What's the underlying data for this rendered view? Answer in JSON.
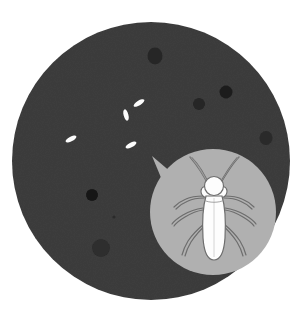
{
  "illustration": {
    "title": "Pest inspection illustration",
    "description": "Dark round surface with scattered dark spots and white insect eggs, with a magnified bubble showing a white winged insect",
    "canvas": {
      "width": 301,
      "height": 332,
      "background": "#ffffff"
    },
    "surface": {
      "label": "dark-round-surface",
      "color": "#3d3d3d",
      "cx": 151,
      "cy": 161,
      "r": 139
    },
    "spots": {
      "label": "dark-spots",
      "color": "#1f1f1f",
      "items": [
        {
          "name": "spot-top",
          "cx": 155,
          "cy": 56,
          "rx": 7.5,
          "ry": 8.5,
          "color": "#262626",
          "opacity": 1
        },
        {
          "name": "spot-upper-right",
          "cx": 226,
          "cy": 92,
          "rx": 6.5,
          "ry": 6.5,
          "color": "#1c1c1c",
          "opacity": 1
        },
        {
          "name": "spot-mid-right",
          "cx": 199,
          "cy": 104,
          "rx": 6,
          "ry": 6,
          "color": "#262626",
          "opacity": 1
        },
        {
          "name": "spot-far-right",
          "cx": 266,
          "cy": 138,
          "rx": 6.5,
          "ry": 7,
          "color": "#2b2b2b",
          "opacity": 1
        },
        {
          "name": "spot-left",
          "cx": 92,
          "cy": 195,
          "rx": 6,
          "ry": 6,
          "color": "#161616",
          "opacity": 1
        },
        {
          "name": "spot-lower-left",
          "cx": 101,
          "cy": 248,
          "rx": 9,
          "ry": 9,
          "color": "#2d2d2d",
          "opacity": 1
        },
        {
          "name": "spot-tiny-center",
          "cx": 114,
          "cy": 217,
          "rx": 1.6,
          "ry": 1.6,
          "color": "#2a2a2a",
          "opacity": 1
        }
      ]
    },
    "eggs": {
      "label": "insect-eggs",
      "color": "#fcfcfc",
      "items": [
        {
          "name": "egg-1",
          "cx": 71,
          "cy": 139,
          "rx": 6.0,
          "ry": 2.4,
          "rotate": -28
        },
        {
          "name": "egg-2",
          "cx": 126,
          "cy": 115,
          "rx": 5.8,
          "ry": 2.4,
          "rotate": 75
        },
        {
          "name": "egg-3",
          "cx": 139,
          "cy": 103,
          "rx": 6.2,
          "ry": 2.4,
          "rotate": -32
        },
        {
          "name": "egg-4",
          "cx": 131,
          "cy": 145,
          "rx": 6.0,
          "ry": 2.4,
          "rotate": -28
        }
      ]
    },
    "magnifier": {
      "label": "magnified-callout-bubble",
      "fill": "#b0b0b0",
      "cx": 213,
      "cy": 212,
      "r": 63,
      "tail": {
        "name": "callout-tail",
        "points": "172,173 152,156 166,190"
      }
    },
    "insect": {
      "label": "white-winged-insect",
      "body_fill": "#fdfdfd",
      "outline": "#6d6d6d",
      "leg_fill": "#9a9a9a",
      "parts": {
        "head": "round head",
        "antennae": "two long V-shaped antennae",
        "thorax": "segmented thorax",
        "abdomen": "elongated tapering abdomen",
        "legs": "six legs"
      }
    }
  }
}
